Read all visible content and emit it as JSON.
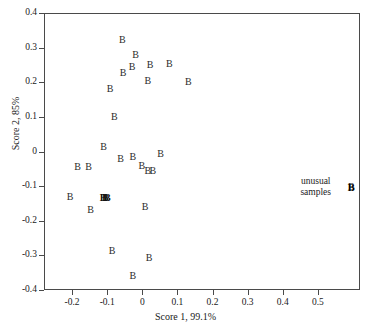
{
  "chart_data": {
    "type": "scatter",
    "title": "",
    "xlabel": "Score 1, 99.1%",
    "ylabel": "Score 2, 85%",
    "xlim": [
      -0.28,
      0.62
    ],
    "ylim": [
      -0.4,
      0.4
    ],
    "xticks": [
      -0.2,
      -0.1,
      0,
      0.1,
      0.2,
      0.3,
      0.4,
      0.5
    ],
    "xticklabels": [
      "-0.2",
      "-0.1",
      "0",
      "0.1",
      "0.2",
      "0.3",
      "0.4",
      "0.5"
    ],
    "yticks": [
      -0.4,
      -0.3,
      -0.2,
      -0.1,
      0,
      0.1,
      0.2,
      0.3,
      0.4
    ],
    "yticklabels": [
      "-0.4",
      "-0.3",
      "-0.2",
      "-0.1",
      "0",
      "0.1",
      "0.2",
      "0.3",
      "0.4"
    ],
    "grid": false,
    "legend": false,
    "marker_label": "B",
    "series": [
      {
        "name": "B",
        "marker": "B",
        "points": [
          {
            "x": -0.057,
            "y": 0.322,
            "label": "B"
          },
          {
            "x": -0.019,
            "y": 0.278,
            "label": "B"
          },
          {
            "x": -0.029,
            "y": 0.243,
            "label": "B"
          },
          {
            "x": -0.055,
            "y": 0.228,
            "label": "B"
          },
          {
            "x": 0.022,
            "y": 0.25,
            "label": "B"
          },
          {
            "x": 0.077,
            "y": 0.252,
            "label": "B"
          },
          {
            "x": 0.016,
            "y": 0.205,
            "label": "B"
          },
          {
            "x": 0.131,
            "y": 0.202,
            "label": "B"
          },
          {
            "x": -0.092,
            "y": 0.181,
            "label": "B"
          },
          {
            "x": -0.08,
            "y": 0.099,
            "label": "B"
          },
          {
            "x": -0.11,
            "y": 0.013,
            "label": "B"
          },
          {
            "x": -0.062,
            "y": -0.022,
            "label": "B"
          },
          {
            "x": -0.027,
            "y": -0.017,
            "label": "B"
          },
          {
            "x": -0.184,
            "y": -0.044,
            "label": "B"
          },
          {
            "x": -0.153,
            "y": -0.044,
            "label": "B"
          },
          {
            "x": -0.001,
            "y": -0.041,
            "label": "B"
          },
          {
            "x": 0.052,
            "y": -0.008,
            "label": "B"
          },
          {
            "x": 0.016,
            "y": -0.057,
            "label": "B"
          },
          {
            "x": 0.03,
            "y": -0.055,
            "label": "B"
          },
          {
            "x": -0.206,
            "y": -0.13,
            "label": "B"
          },
          {
            "x": -0.112,
            "y": -0.133,
            "label": "BBB"
          },
          {
            "x": -0.147,
            "y": -0.169,
            "label": "B"
          },
          {
            "x": 0.008,
            "y": -0.161,
            "label": "B"
          },
          {
            "x": -0.086,
            "y": -0.288,
            "label": "B"
          },
          {
            "x": 0.019,
            "y": -0.309,
            "label": "B"
          },
          {
            "x": -0.027,
            "y": -0.36,
            "label": "B"
          },
          {
            "x": 0.595,
            "y": -0.103,
            "label": "B"
          }
        ]
      }
    ],
    "annotations": [
      {
        "name": "unusual-samples",
        "text_line_1": "unusual",
        "text_line_2": "samples",
        "target_x": 0.595,
        "target_y": -0.103
      }
    ]
  },
  "axis": {
    "x_title": "Score 1, 99.1%",
    "y_title": "Score 2, 85%"
  }
}
